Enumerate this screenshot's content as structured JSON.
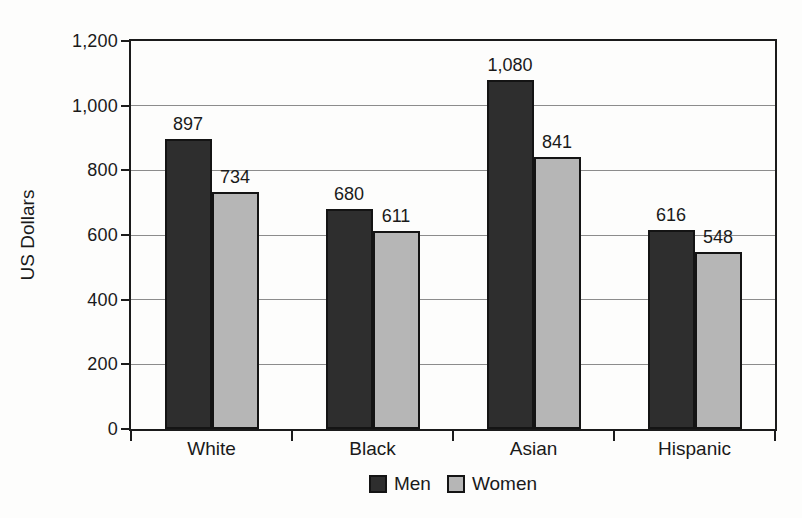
{
  "colors": {
    "background": "#fdfdfc",
    "axis": "#1b1b1b",
    "gridline": "#8c8c8c",
    "text": "#1a1a1a",
    "men_bar": "#2e2e2e",
    "women_bar": "#b6b6b6"
  },
  "chart_data": {
    "type": "bar",
    "title": "",
    "xlabel": "",
    "ylabel": "US Dollars",
    "categories": [
      "White",
      "Black",
      "Asian",
      "Hispanic"
    ],
    "series": [
      {
        "name": "Men",
        "color": "#2e2e2e",
        "values": [
          897,
          680,
          1080,
          616
        ],
        "labels": [
          "897",
          "680",
          "1,080",
          "616"
        ]
      },
      {
        "name": "Women",
        "color": "#b6b6b6",
        "values": [
          734,
          611,
          841,
          548
        ],
        "labels": [
          "734",
          "611",
          "841",
          "548"
        ]
      }
    ],
    "ylim": [
      0,
      1200
    ],
    "yticks": [
      {
        "value": 0,
        "label": "0"
      },
      {
        "value": 200,
        "label": "200"
      },
      {
        "value": 400,
        "label": "400"
      },
      {
        "value": 600,
        "label": "600"
      },
      {
        "value": 800,
        "label": "800"
      },
      {
        "value": 1000,
        "label": "1,000"
      },
      {
        "value": 1200,
        "label": "1,200"
      }
    ],
    "grid": true,
    "legend_position": "bottom"
  }
}
